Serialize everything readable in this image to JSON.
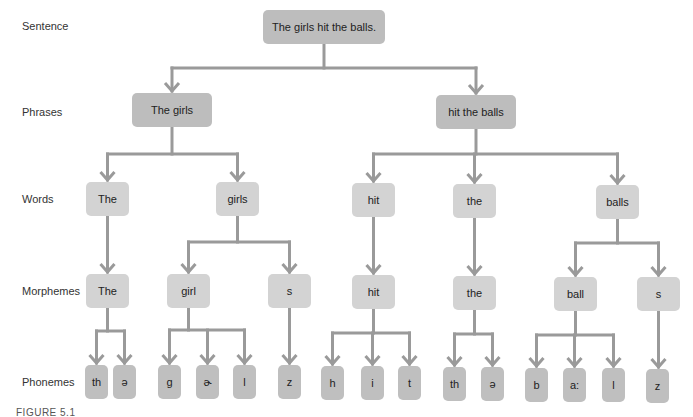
{
  "levels": {
    "sentence": "Sentence",
    "phrases": "Phrases",
    "words": "Words",
    "morphemes": "Morphemes",
    "phonemes": "Phonemes"
  },
  "tree": {
    "sentence": "The girls hit the balls.",
    "phrases": [
      "The girls",
      "hit the balls"
    ],
    "words": [
      "The",
      "girls",
      "hit",
      "the",
      "balls"
    ],
    "morphemes": [
      "The",
      "girl",
      "s",
      "hit",
      "the",
      "ball",
      "s"
    ],
    "phonemes": [
      "th",
      "ə",
      "g",
      "ɚ",
      "l",
      "z",
      "h",
      "i",
      "t",
      "th",
      "ə",
      "b",
      "a:",
      "l",
      "z"
    ]
  },
  "caption": "FIGURE 5.1",
  "colors": {
    "node_dark": "#bdbdbd",
    "node_light": "#d3d3d3",
    "edge": "#9a9a9a"
  }
}
